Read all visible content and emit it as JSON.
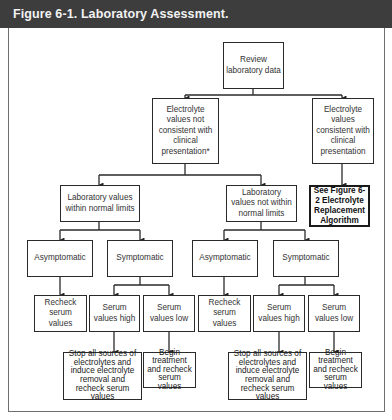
{
  "header": {
    "title": "Figure 6-1. Laboratory Assessment."
  },
  "nodes": {
    "review": "Review laboratory data",
    "not_consistent": "Electrolyte values not consistent with clinical presentation*",
    "consistent": "Electrolyte values consistent with clinical presentation",
    "see_fig": "See Figure 6-2 Electrolyte Replacement Algorithm",
    "within_limits": "Laboratory values within normal limits",
    "not_within_limits": "Laboratory values not within normal limits",
    "asymptomatic_left": "Asymptomatic",
    "symptomatic_left": "Symptomatic",
    "asymptomatic_right": "Asymptomatic",
    "symptomatic_right": "Symptomatic",
    "recheck_left": "Recheck serum values",
    "serum_high_left": "Serum values high",
    "serum_low_left": "Serum values low",
    "recheck_right": "Recheck serum values",
    "serum_high_right": "Serum values high",
    "serum_low_right": "Serum values low",
    "stop_left": "Stop all sources of electrolytes and induce electrolyte removal and recheck serum values",
    "begin_left": "Begin treatment and recheck serum values",
    "stop_right": "Stop all sources of electrolytes and induce electrolyte removal and recheck serum values",
    "begin_right": "Begin treatment and recheck serum values"
  },
  "colors": {
    "header_bg": "#3d3d3d",
    "header_text": "#f2f2f2",
    "box_border": "#2a2a2a",
    "frame": "#6e6e6e"
  }
}
